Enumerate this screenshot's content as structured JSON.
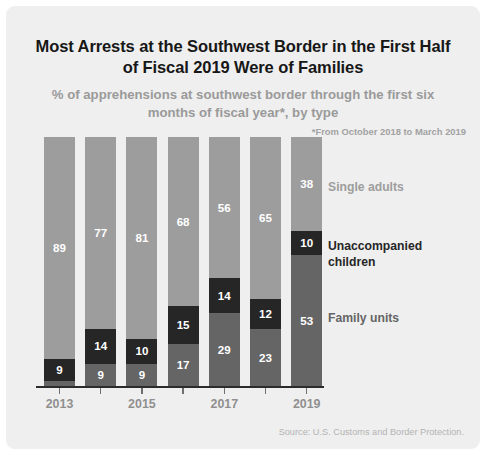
{
  "title": "Most Arrests at the Southwest Border in the First Half of Fiscal 2019 Were of Families",
  "subtitle": "% of apprehensions at southwest border through the first six months of fiscal year*, by type",
  "footnote": "*From October 2018 to March 2019",
  "source": "Source: U.S. Customs and Border Protection.",
  "colors": {
    "single_adults": "#9d9d9d",
    "unaccompanied_children": "#262626",
    "family_units": "#656565",
    "background": "#efefef",
    "axis": "#2b2b2b",
    "tick_label": "#8f8f8f"
  },
  "legend": {
    "single_adults": "Single adults",
    "unaccompanied_children": "Unaccompanied children",
    "family_units": "Family units"
  },
  "axis": {
    "tick_labels": [
      "2013",
      "2015",
      "2017",
      "2019"
    ]
  },
  "chart_data": {
    "type": "bar",
    "title": "Most Arrests at the Southwest Border in the First Half of Fiscal 2019 Were of Families",
    "subtitle": "% of apprehensions at southwest border through the first six months of fiscal year*, by type",
    "xlabel": "",
    "ylabel": "% of apprehensions",
    "ylim": [
      0,
      100
    ],
    "stacked": true,
    "stack_order": [
      "family_units",
      "unaccompanied_children",
      "single_adults"
    ],
    "grid": false,
    "legend_position": "right",
    "categories": [
      "2013",
      "2014",
      "2015",
      "2016",
      "2017",
      "2018",
      "2019"
    ],
    "series": [
      {
        "name": "Single adults",
        "values": [
          89,
          77,
          81,
          68,
          56,
          65,
          38
        ]
      },
      {
        "name": "Unaccompanied children",
        "values": [
          9,
          14,
          10,
          15,
          14,
          12,
          10
        ]
      },
      {
        "name": "Family units",
        "values": [
          2,
          9,
          9,
          17,
          29,
          23,
          53
        ]
      }
    ],
    "labels": {
      "2013": {
        "single_adults": "89",
        "unaccompanied_children": "9",
        "family_units": ""
      },
      "2014": {
        "single_adults": "77",
        "unaccompanied_children": "14",
        "family_units": "9"
      },
      "2015": {
        "single_adults": "81",
        "unaccompanied_children": "10",
        "family_units": "9"
      },
      "2016": {
        "single_adults": "68",
        "unaccompanied_children": "15",
        "family_units": "17"
      },
      "2017": {
        "single_adults": "56",
        "unaccompanied_children": "14",
        "family_units": "29"
      },
      "2018": {
        "single_adults": "65",
        "unaccompanied_children": "12",
        "family_units": "23"
      },
      "2019": {
        "single_adults": "38",
        "unaccompanied_children": "10",
        "family_units": "53"
      }
    },
    "annotations": [
      "*From October 2018 to March 2019"
    ],
    "source": "Source: U.S. Customs and Border Protection."
  }
}
